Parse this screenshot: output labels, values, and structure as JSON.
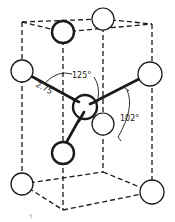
{
  "diagram": {
    "title": "",
    "type": "crystal-structure-unit-cell",
    "colors": {
      "ink": "#1a1a1a",
      "background": "#ffffff"
    },
    "labels": {
      "bond_length": "2.75",
      "angle_upper": "125°",
      "angle_right": "102°",
      "corner_mark": "τ"
    },
    "atoms": [
      {
        "id": "top-back",
        "cx": 103,
        "cy": 19,
        "r": 11,
        "bold": false
      },
      {
        "id": "top-front",
        "cx": 63,
        "cy": 32,
        "r": 11,
        "bold": true
      },
      {
        "id": "left",
        "cx": 22,
        "cy": 71,
        "r": 11,
        "bold": false
      },
      {
        "id": "right",
        "cx": 150,
        "cy": 74,
        "r": 12,
        "bold": false
      },
      {
        "id": "center",
        "cx": 85,
        "cy": 107,
        "r": 12,
        "bold": true
      },
      {
        "id": "mid-back",
        "cx": 103,
        "cy": 124,
        "r": 11,
        "bold": false
      },
      {
        "id": "lower-front",
        "cx": 63,
        "cy": 153,
        "r": 11,
        "bold": true
      },
      {
        "id": "bottom-left",
        "cx": 22,
        "cy": 184,
        "r": 11,
        "bold": false
      },
      {
        "id": "bottom-right",
        "cx": 152,
        "cy": 192,
        "r": 12,
        "bold": false
      }
    ]
  }
}
